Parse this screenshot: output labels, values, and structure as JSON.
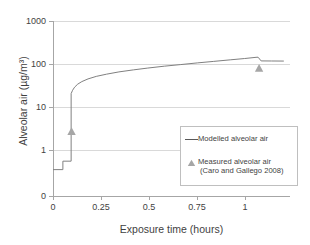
{
  "chart_data": {
    "type": "line",
    "title": "",
    "xlabel": "Exposure time (hours)",
    "ylabel": "Alveolar air (µg/m³)",
    "xlim": [
      0,
      1.15
    ],
    "ylim_log": [
      0.3,
      1000
    ],
    "yscale": "log",
    "grid": true,
    "legend_position": "inside-right",
    "xticks": [
      "0",
      "0.25",
      "0.5",
      "0.75",
      "1"
    ],
    "xtick_values": [
      0,
      0.25,
      0.5,
      0.75,
      1
    ],
    "yticks": [
      "0",
      "1",
      "10",
      "100",
      "1000"
    ],
    "ytick_values": [
      0,
      1,
      10,
      100,
      1000
    ],
    "series": [
      {
        "name": "Modelled alveolar air",
        "type": "line",
        "color": "#808080",
        "x": [
          0,
          0.048,
          0.048,
          0.088,
          0.088,
          0.095,
          0.105,
          0.12,
          0.14,
          0.17,
          0.21,
          0.26,
          0.32,
          0.39,
          0.46,
          0.54,
          0.62,
          0.7,
          0.78,
          0.86,
          0.93,
          0.985,
          0.995,
          1.01,
          1.06,
          1.12
        ],
        "y": [
          0.35,
          0.35,
          0.55,
          0.55,
          20.5,
          24.5,
          29.0,
          34.0,
          39.0,
          45.0,
          51.5,
          58.0,
          65.5,
          73.0,
          80.5,
          89.0,
          97.0,
          106.0,
          115.0,
          125.0,
          134.0,
          143.0,
          144.0,
          118.0,
          117.5,
          117.0
        ]
      },
      {
        "name": "Measured alveolar air (Caro and Gallego 2008)",
        "type": "scatter",
        "marker": "triangle",
        "color": "#a6a6a6",
        "points": [
          {
            "x": 0.09,
            "y": 2.7
          },
          {
            "x": 1.0,
            "y": 80
          }
        ]
      }
    ]
  },
  "legend": {
    "modelled_label": "Modelled alveolar air",
    "measured_label_line1": "Measured alveolar air",
    "measured_label_line2": "(Caro and Gallego 2008)"
  },
  "colors": {
    "line": "#808080",
    "marker": "#a6a6a6",
    "grid": "#d9d9d9",
    "axis": "#a6a6a6",
    "text": "#3f3f3f",
    "legend_border": "#bfbfbf",
    "background": "#ffffff"
  }
}
